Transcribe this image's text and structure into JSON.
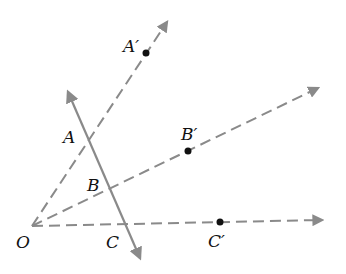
{
  "diagram": {
    "type": "dilation-rays",
    "colors": {
      "line": "#8a8a8a",
      "point": "#111111",
      "text": "#111111"
    },
    "origin": {
      "label": "O",
      "x": 32,
      "y": 226
    },
    "transversal": {
      "x1": 66,
      "y1": 88,
      "x2": 142,
      "y2": 262
    },
    "rays": [
      {
        "name": "ray-OA",
        "x2": 169,
        "y2": 19
      },
      {
        "name": "ray-OB",
        "x2": 322,
        "y2": 86
      },
      {
        "name": "ray-OC",
        "x2": 325,
        "y2": 220
      }
    ],
    "points": {
      "A": {
        "label": "A",
        "x": 87,
        "y": 137
      },
      "B": {
        "label": "B",
        "x": 110,
        "y": 187
      },
      "C": {
        "label": "C",
        "x": 126,
        "y": 223
      },
      "A_prime": {
        "label": "A′",
        "x": 146,
        "y": 53
      },
      "B_prime": {
        "label": "B′",
        "x": 188,
        "y": 151
      },
      "C_prime": {
        "label": "C′",
        "x": 220,
        "y": 222
      }
    }
  }
}
